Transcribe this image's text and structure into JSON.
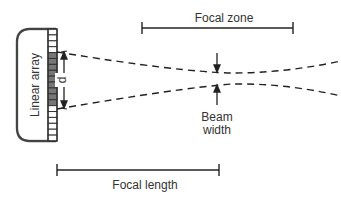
{
  "diagram": {
    "labels": {
      "focal_zone": "Focal zone",
      "focal_length": "Focal length",
      "beam_width_line1": "Beam",
      "beam_width_line2": "width",
      "linear_array": "Linear array",
      "aperture": "d"
    },
    "array": {
      "total_elements": 19,
      "active_elements": 9,
      "active_start_index": 4,
      "active_color": "#777777",
      "inactive_color": "#ffffff"
    },
    "colors": {
      "stroke": "#222222",
      "text": "#333333"
    }
  }
}
